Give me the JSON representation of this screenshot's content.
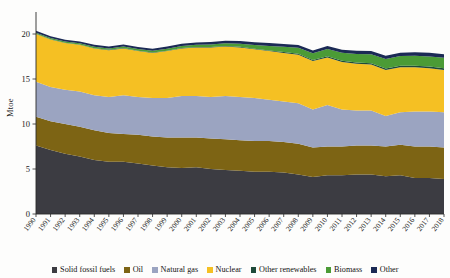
{
  "chart_data": {
    "type": "area",
    "stacked": true,
    "title": "",
    "subtitle": "",
    "xlabel": "",
    "ylabel": "Mtoe",
    "ylim": [
      0,
      22
    ],
    "yticks": [
      0,
      5,
      10,
      15,
      20
    ],
    "ytick_labels": [
      "0",
      "5",
      "10",
      "15",
      "20"
    ],
    "grid": false,
    "legend_position": "bottom",
    "categories": [
      "1990",
      "1991",
      "1992",
      "1993",
      "1994",
      "1995",
      "1996",
      "1997",
      "1998",
      "1999",
      "2000",
      "2001",
      "2002",
      "2003",
      "2004",
      "2005",
      "2006",
      "2007",
      "2008",
      "2009",
      "2010",
      "2011",
      "2012",
      "2013",
      "2014",
      "2015",
      "2016",
      "2017",
      "2018"
    ],
    "series": [
      {
        "name": "Solid fossil fuels",
        "color": "#3c3c42",
        "values": [
          7.6,
          7.1,
          6.7,
          6.4,
          6.0,
          5.8,
          5.8,
          5.6,
          5.4,
          5.2,
          5.1,
          5.2,
          5.0,
          4.9,
          4.8,
          4.7,
          4.7,
          4.6,
          4.4,
          4.1,
          4.3,
          4.3,
          4.4,
          4.4,
          4.2,
          4.3,
          4.0,
          4.0,
          3.9
        ]
      },
      {
        "name": "Oil",
        "color": "#7d6414",
        "values": [
          3.2,
          3.2,
          3.3,
          3.3,
          3.3,
          3.2,
          3.1,
          3.2,
          3.2,
          3.3,
          3.4,
          3.3,
          3.4,
          3.4,
          3.4,
          3.4,
          3.4,
          3.4,
          3.4,
          3.3,
          3.2,
          3.2,
          3.2,
          3.2,
          3.3,
          3.4,
          3.5,
          3.5,
          3.5
        ]
      },
      {
        "name": "Natural gas",
        "color": "#9ba4c1",
        "values": [
          3.9,
          3.8,
          3.8,
          3.9,
          3.9,
          4.0,
          4.3,
          4.2,
          4.3,
          4.4,
          4.6,
          4.6,
          4.6,
          4.8,
          4.8,
          4.8,
          4.6,
          4.5,
          4.5,
          4.2,
          4.6,
          4.1,
          3.9,
          3.9,
          3.4,
          3.6,
          3.9,
          3.9,
          3.9
        ]
      },
      {
        "name": "Nuclear",
        "color": "#f5c023",
        "values": [
          5.3,
          5.3,
          5.2,
          5.2,
          5.2,
          5.2,
          5.2,
          5.1,
          5.0,
          5.2,
          5.3,
          5.4,
          5.5,
          5.5,
          5.5,
          5.4,
          5.4,
          5.4,
          5.4,
          5.4,
          5.3,
          5.3,
          5.2,
          5.1,
          5.1,
          5.0,
          4.9,
          4.8,
          4.7
        ]
      },
      {
        "name": "Other renewables",
        "color": "#1e4a3a",
        "values": [
          0.03,
          0.03,
          0.03,
          0.03,
          0.03,
          0.04,
          0.04,
          0.04,
          0.04,
          0.05,
          0.05,
          0.05,
          0.06,
          0.06,
          0.07,
          0.07,
          0.08,
          0.09,
          0.1,
          0.11,
          0.12,
          0.13,
          0.14,
          0.15,
          0.16,
          0.17,
          0.18,
          0.19,
          0.2
        ]
      },
      {
        "name": "Biomass",
        "color": "#4b9b36",
        "values": [
          0.12,
          0.12,
          0.13,
          0.14,
          0.15,
          0.16,
          0.17,
          0.18,
          0.19,
          0.21,
          0.23,
          0.25,
          0.28,
          0.32,
          0.36,
          0.42,
          0.5,
          0.58,
          0.66,
          0.74,
          0.82,
          0.88,
          0.94,
          1.0,
          1.05,
          1.08,
          1.1,
          1.12,
          1.15
        ]
      },
      {
        "name": "Other",
        "color": "#1b2a55",
        "values": [
          0.2,
          0.2,
          0.21,
          0.21,
          0.22,
          0.22,
          0.23,
          0.23,
          0.24,
          0.24,
          0.25,
          0.26,
          0.27,
          0.28,
          0.29,
          0.3,
          0.31,
          0.32,
          0.33,
          0.32,
          0.33,
          0.34,
          0.35,
          0.36,
          0.37,
          0.38,
          0.39,
          0.4,
          0.41
        ]
      }
    ]
  },
  "legend": {
    "items": [
      {
        "label": "Solid fossil fuels",
        "color": "#3c3c42"
      },
      {
        "label": "Oil",
        "color": "#7d6414"
      },
      {
        "label": "Natural gas",
        "color": "#9ba4c1"
      },
      {
        "label": "Nuclear",
        "color": "#f5c023"
      },
      {
        "label": "Other renewables",
        "color": "#1e4a3a"
      },
      {
        "label": "Biomass",
        "color": "#4b9b36"
      },
      {
        "label": "Other",
        "color": "#1b2a55"
      }
    ]
  }
}
